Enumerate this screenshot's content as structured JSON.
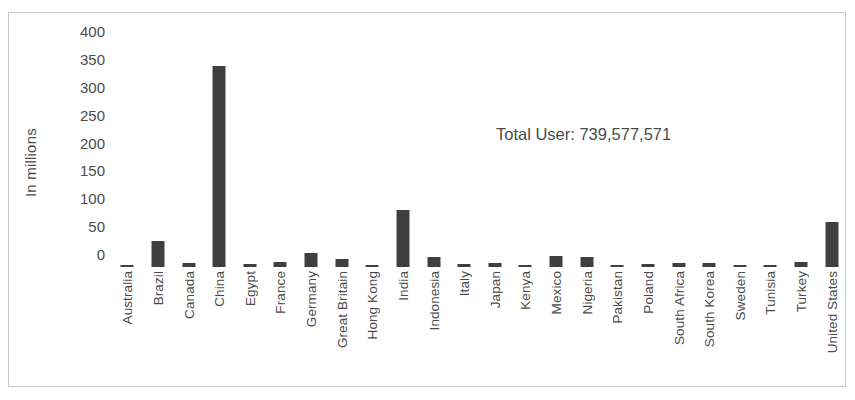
{
  "chart_data": {
    "type": "bar",
    "title": "",
    "xlabel": "",
    "ylabel": "In millions",
    "ylim": [
      0,
      400
    ],
    "yticks": [
      400,
      350,
      300,
      250,
      200,
      150,
      100,
      50,
      0
    ],
    "grid": false,
    "legend": "none",
    "annotation": "Total User: 739,577,571",
    "bar_color": "#3f3f3f",
    "categories": [
      "Australia",
      "Brazil",
      "Canada",
      "China",
      "Egypt",
      "France",
      "Germany",
      "Great Britain",
      "Hong Kong",
      "India",
      "Indonesia",
      "Italy",
      "Japan",
      "Kenya",
      "Mexico",
      "Nigeria",
      "Pakistan",
      "Poland",
      "South Africa",
      "South Korea",
      "Sweden",
      "Tunisia",
      "Turkey",
      "United States"
    ],
    "values": [
      4,
      46,
      8,
      359,
      6,
      9,
      25,
      15,
      2,
      101,
      17,
      5,
      7,
      2,
      20,
      17,
      3,
      6,
      7,
      8,
      3,
      2,
      9,
      81
    ]
  },
  "annotation": {
    "total_user_label": "Total User: 739,577,571"
  },
  "axis": {
    "y_title": "In millions"
  }
}
